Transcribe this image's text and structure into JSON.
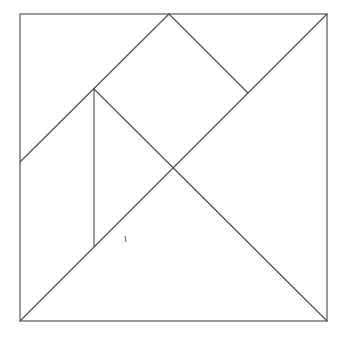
{
  "diagram": {
    "type": "tangram",
    "stroke_color": "#4a4a4a",
    "background": "#ffffff",
    "square": {
      "x1": 20,
      "y1": 14,
      "x2": 327,
      "y2": 321
    },
    "points": {
      "TL": [
        20,
        14
      ],
      "TR": [
        327,
        14
      ],
      "BL": [
        20,
        321
      ],
      "BR": [
        327,
        321
      ],
      "TOP_MID": [
        169,
        14
      ],
      "LEFT_MID": [
        20,
        162
      ],
      "P_UPPER": [
        94,
        89
      ],
      "P_LOWER": [
        94,
        246
      ],
      "CENTER": [
        174,
        167
      ],
      "P_RIGHT": [
        248,
        93
      ]
    },
    "segments": [
      {
        "name": "left-edge-to-top-mid-diagonal",
        "from": "LEFT_MID",
        "to": "TOP_MID"
      },
      {
        "name": "top-mid-to-right-point",
        "from": "TOP_MID",
        "to": "P_RIGHT"
      },
      {
        "name": "main-diagonal-bl-tr",
        "from": "BL",
        "to": "TR"
      },
      {
        "name": "upper-point-to-br-diagonal",
        "from": "P_UPPER",
        "to": "BR"
      },
      {
        "name": "vertical-parallelogram-edge",
        "from": "P_UPPER",
        "to": "P_LOWER"
      }
    ],
    "stray_mark": [
      125,
      236,
      126,
      242
    ]
  }
}
